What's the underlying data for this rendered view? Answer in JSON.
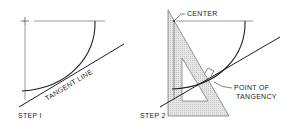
{
  "figure": {
    "type": "technical-drawing"
  },
  "step1": {
    "label": "STEP I",
    "tangent_line_label": "TANGENT LINE"
  },
  "step2": {
    "label": "STEP 2",
    "center_label": "CENTER",
    "point_label_line1": "POINT OF",
    "point_label_line2": "TANGENCY"
  },
  "colors": {
    "line": "#222222",
    "triangle_fill": "#d9d9d9",
    "background": "#ffffff"
  }
}
